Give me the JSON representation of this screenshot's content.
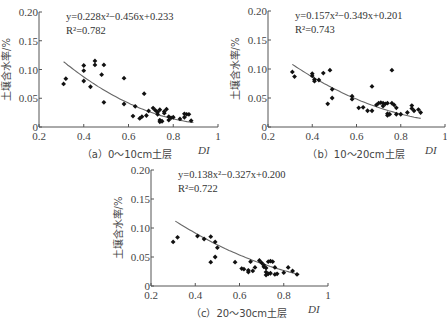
{
  "chart_data": [
    {
      "id": "a",
      "type": "scatter",
      "caption": "（a）0～10cm土层",
      "xlabel": "DI",
      "ylabel": "土壤含水率/%",
      "xlim": [
        0.2,
        1.0
      ],
      "ylim": [
        0,
        0.2
      ],
      "xticks": [
        "0.2",
        "0.4",
        "0.6",
        "0.8",
        "1"
      ],
      "yticks": [
        "0",
        "0.05",
        "0.10",
        "0.15",
        "0.20"
      ],
      "equation": "y=0.228x²−0.456x+0.233",
      "r2": "R²=0.782",
      "fit": {
        "a": 0.228,
        "b": -0.456,
        "c": 0.233,
        "x_range": [
          0.31,
          0.89
        ]
      },
      "points": [
        [
          0.31,
          0.075
        ],
        [
          0.32,
          0.084
        ],
        [
          0.4,
          0.107
        ],
        [
          0.4,
          0.098
        ],
        [
          0.4,
          0.08
        ],
        [
          0.43,
          0.07
        ],
        [
          0.45,
          0.115
        ],
        [
          0.45,
          0.108
        ],
        [
          0.48,
          0.091
        ],
        [
          0.49,
          0.108
        ],
        [
          0.49,
          0.043
        ],
        [
          0.58,
          0.085
        ],
        [
          0.58,
          0.04
        ],
        [
          0.62,
          0.019
        ],
        [
          0.63,
          0.036
        ],
        [
          0.65,
          0.015
        ],
        [
          0.66,
          0.018
        ],
        [
          0.67,
          0.058
        ],
        [
          0.68,
          0.02
        ],
        [
          0.69,
          0.028
        ],
        [
          0.71,
          0.033
        ],
        [
          0.72,
          0.029
        ],
        [
          0.73,
          0.022
        ],
        [
          0.73,
          0.026
        ],
        [
          0.74,
          0.03
        ],
        [
          0.74,
          0.012
        ],
        [
          0.74,
          0.009
        ],
        [
          0.75,
          0.01
        ],
        [
          0.76,
          0.027
        ],
        [
          0.76,
          0.024
        ],
        [
          0.77,
          0.031
        ],
        [
          0.78,
          0.018
        ],
        [
          0.78,
          0.012
        ],
        [
          0.79,
          0.016
        ],
        [
          0.8,
          0.017
        ],
        [
          0.83,
          0.014
        ],
        [
          0.85,
          0.017
        ],
        [
          0.85,
          0.023
        ],
        [
          0.86,
          0.022
        ],
        [
          0.87,
          0.022
        ],
        [
          0.88,
          0.011
        ]
      ]
    },
    {
      "id": "b",
      "type": "scatter",
      "caption": "（b）10～20cm土层",
      "xlabel": "DI",
      "ylabel": "土壤含水率/%",
      "xlim": [
        0.2,
        1.0
      ],
      "ylim": [
        0,
        0.2
      ],
      "xticks": [
        "0.2",
        "0.4",
        "0.6",
        "0.8",
        "1"
      ],
      "yticks": [
        "0",
        "0.05",
        "0.10",
        "0.15",
        "0.20"
      ],
      "equation": "y=0.157x²−0.349x+0.201",
      "r2": "R²=0.743",
      "fit": {
        "a": 0.157,
        "b": -0.349,
        "c": 0.201,
        "x_range": [
          0.31,
          0.89
        ]
      },
      "points": [
        [
          0.31,
          0.095
        ],
        [
          0.32,
          0.087
        ],
        [
          0.4,
          0.092
        ],
        [
          0.4,
          0.088
        ],
        [
          0.41,
          0.082
        ],
        [
          0.41,
          0.079
        ],
        [
          0.43,
          0.081
        ],
        [
          0.45,
          0.093
        ],
        [
          0.47,
          0.04
        ],
        [
          0.48,
          0.098
        ],
        [
          0.49,
          0.065
        ],
        [
          0.49,
          0.05
        ],
        [
          0.58,
          0.053
        ],
        [
          0.58,
          0.048
        ],
        [
          0.61,
          0.033
        ],
        [
          0.63,
          0.034
        ],
        [
          0.65,
          0.028
        ],
        [
          0.67,
          0.07
        ],
        [
          0.67,
          0.028
        ],
        [
          0.69,
          0.038
        ],
        [
          0.7,
          0.041
        ],
        [
          0.71,
          0.042
        ],
        [
          0.72,
          0.036
        ],
        [
          0.72,
          0.041
        ],
        [
          0.73,
          0.04
        ],
        [
          0.74,
          0.041
        ],
        [
          0.74,
          0.023
        ],
        [
          0.74,
          0.02
        ],
        [
          0.75,
          0.022
        ],
        [
          0.76,
          0.041
        ],
        [
          0.76,
          0.098
        ],
        [
          0.77,
          0.038
        ],
        [
          0.78,
          0.022
        ],
        [
          0.78,
          0.033
        ],
        [
          0.8,
          0.022
        ],
        [
          0.83,
          0.025
        ],
        [
          0.85,
          0.037
        ],
        [
          0.85,
          0.032
        ],
        [
          0.86,
          0.028
        ],
        [
          0.88,
          0.03
        ],
        [
          0.89,
          0.025
        ]
      ]
    },
    {
      "id": "c",
      "type": "scatter",
      "caption": "（c）20～30cm土层",
      "xlabel": "DI",
      "ylabel": "土壤含水率/%",
      "xlim": [
        0.2,
        1.0
      ],
      "ylim": [
        0,
        0.2
      ],
      "xticks": [
        "0.2",
        "0.4",
        "0.6",
        "0.8",
        "1"
      ],
      "yticks": [
        "0",
        "0.05",
        "0.10",
        "0.15",
        "0.20"
      ],
      "equation": "y=0.138x²−0.327x+0.200",
      "r2": "R²=0.722",
      "fit": {
        "a": 0.138,
        "b": -0.327,
        "c": 0.2,
        "x_range": [
          0.31,
          0.87
        ]
      },
      "points": [
        [
          0.3,
          0.076
        ],
        [
          0.32,
          0.084
        ],
        [
          0.41,
          0.086
        ],
        [
          0.44,
          0.081
        ],
        [
          0.47,
          0.085
        ],
        [
          0.47,
          0.041
        ],
        [
          0.49,
          0.076
        ],
        [
          0.49,
          0.05
        ],
        [
          0.5,
          0.066
        ],
        [
          0.58,
          0.041
        ],
        [
          0.61,
          0.03
        ],
        [
          0.62,
          0.029
        ],
        [
          0.64,
          0.024
        ],
        [
          0.64,
          0.027
        ],
        [
          0.65,
          0.042
        ],
        [
          0.66,
          0.026
        ],
        [
          0.67,
          0.032
        ],
        [
          0.69,
          0.044
        ],
        [
          0.7,
          0.04
        ],
        [
          0.71,
          0.033
        ],
        [
          0.71,
          0.036
        ],
        [
          0.72,
          0.031
        ],
        [
          0.72,
          0.024
        ],
        [
          0.72,
          0.019
        ],
        [
          0.73,
          0.021
        ],
        [
          0.73,
          0.042
        ],
        [
          0.74,
          0.022
        ],
        [
          0.74,
          0.043
        ],
        [
          0.75,
          0.042
        ],
        [
          0.76,
          0.02
        ],
        [
          0.76,
          0.032
        ],
        [
          0.77,
          0.021
        ],
        [
          0.8,
          0.023
        ],
        [
          0.82,
          0.032
        ],
        [
          0.84,
          0.026
        ],
        [
          0.86,
          0.02
        ]
      ]
    }
  ],
  "layout": [
    {
      "ox": 39,
      "x1": 218,
      "yTop": 12,
      "y0": 127
    },
    {
      "ox": 268,
      "x1": 445,
      "yTop": 11,
      "y0": 127
    },
    {
      "ox": 151,
      "x1": 328,
      "yTop": 170,
      "y0": 286
    }
  ]
}
